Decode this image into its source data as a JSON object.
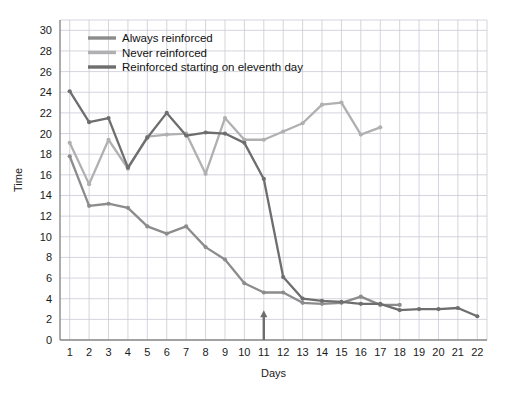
{
  "chart_data": {
    "type": "line",
    "title": "",
    "xlabel": "Days",
    "ylabel": "Time",
    "xlim": [
      0.5,
      22.5
    ],
    "ylim": [
      0,
      31
    ],
    "xticks": [
      1,
      2,
      3,
      4,
      5,
      6,
      7,
      8,
      9,
      10,
      11,
      12,
      13,
      14,
      15,
      16,
      17,
      18,
      19,
      20,
      21,
      22
    ],
    "yticks": [
      0,
      2,
      4,
      6,
      8,
      10,
      12,
      14,
      16,
      18,
      20,
      22,
      24,
      26,
      28,
      30
    ],
    "grid": true,
    "legend_position": "top-left",
    "series": [
      {
        "name": "Always reinforced",
        "color": "#8c8c8c",
        "x": [
          1,
          2,
          3,
          4,
          5,
          6,
          7,
          8,
          9,
          10,
          11,
          12,
          13,
          14,
          15,
          16,
          17,
          18
        ],
        "values": [
          17.8,
          13.0,
          13.2,
          12.8,
          11.0,
          10.3,
          11.0,
          9.0,
          7.8,
          5.5,
          4.6,
          4.6,
          3.6,
          3.5,
          3.6,
          4.2,
          3.4,
          3.4
        ]
      },
      {
        "name": "Never reinforced",
        "color": "#b0b0b0",
        "x": [
          1,
          2,
          3,
          4,
          5,
          6,
          7,
          8,
          9,
          10,
          11,
          12,
          13,
          14,
          15,
          16,
          17
        ],
        "values": [
          19.1,
          15.1,
          19.4,
          16.6,
          19.7,
          19.9,
          20.0,
          16.1,
          21.5,
          19.4,
          19.4,
          20.2,
          21.0,
          22.8,
          23.0,
          19.9,
          20.6
        ]
      },
      {
        "name": "Reinforced starting on eleventh day",
        "color": "#6e6e6e",
        "x": [
          1,
          2,
          3,
          4,
          5,
          6,
          7,
          8,
          9,
          10,
          11,
          12,
          13,
          14,
          15,
          16,
          17,
          18,
          19,
          20,
          21,
          22
        ],
        "values": [
          24.1,
          21.1,
          21.5,
          16.7,
          19.6,
          22.0,
          19.8,
          20.1,
          20.0,
          19.1,
          15.6,
          6.1,
          4.0,
          3.8,
          3.7,
          3.5,
          3.5,
          2.9,
          3.0,
          3.0,
          3.1,
          2.3
        ]
      }
    ],
    "annotations": [
      {
        "name": "eleventh-day-marker",
        "type": "up-arrow",
        "x": 11,
        "y0": 0,
        "y1": 2.6
      }
    ]
  },
  "legend": {
    "items": [
      {
        "label": "Always reinforced",
        "color": "#8c8c8c"
      },
      {
        "label": "Never reinforced",
        "color": "#b0b0b0"
      },
      {
        "label": "Reinforced starting on eleventh day",
        "color": "#6e6e6e"
      }
    ]
  }
}
